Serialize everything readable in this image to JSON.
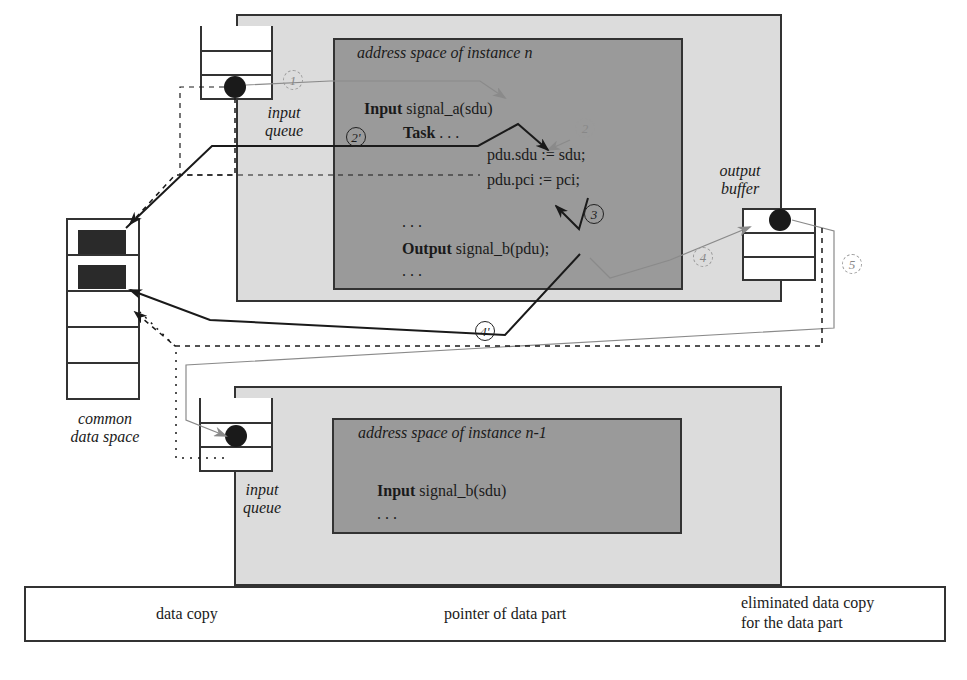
{
  "instance_n": {
    "title": "address space of instance n",
    "code": {
      "input_kw": "Input",
      "input_sig": " signal_a(sdu)",
      "task_kw": "Task",
      "task_rest": " . . .",
      "line_sdu": "pdu.sdu := sdu;",
      "line_pci": "pdu.pci := pci;",
      "ellipsis1": ". . .",
      "output_kw": "Output",
      "output_sig": " signal_b(pdu);",
      "ellipsis2": ". . ."
    },
    "input_queue_label_1": "input",
    "input_queue_label_2": "queue",
    "output_buffer_label_1": "output",
    "output_buffer_label_2": "buffer"
  },
  "instance_n1": {
    "title": "address space of instance n-1",
    "code": {
      "input_kw": "Input",
      "input_sig": " signal_b(sdu)",
      "ellipsis": ". . ."
    },
    "input_queue_label_1": "input",
    "input_queue_label_2": "queue"
  },
  "common_data_space": {
    "label_1": "common",
    "label_2": "data space"
  },
  "steps": {
    "s1": "1",
    "s2": "2",
    "s2p": "2'",
    "s3": "3",
    "s4": "4",
    "s4p": "4'",
    "s5": "5"
  },
  "legend": {
    "items": [
      {
        "label": "data copy",
        "style": "solid-black-arrow"
      },
      {
        "label": "pointer of data part",
        "style": "dotted-black-arrow"
      },
      {
        "label_1": "eliminated data copy",
        "label_2": "for the data part",
        "style": "gray-arrow"
      }
    ]
  },
  "colors": {
    "outer_bg": "#dcdcdc",
    "inner_bg": "#9a9a9a",
    "line": "#1a1a1a",
    "eliminated": "#8a8a8a"
  }
}
